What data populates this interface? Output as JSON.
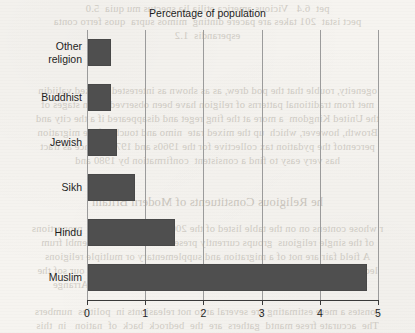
{
  "chart_data": {
    "type": "bar",
    "orientation": "horizontal",
    "title": "Percentage of population",
    "xlabel": "",
    "ylabel": "",
    "categories": [
      "Other religion",
      "Buddhist",
      "Jewish",
      "Sikh",
      "Hindu",
      "Muslim"
    ],
    "values": [
      0.4,
      0.4,
      0.5,
      0.8,
      1.5,
      4.8
    ],
    "xlim": [
      0,
      5
    ],
    "xticks": [
      0,
      1,
      2,
      3,
      4,
      5
    ],
    "xtick_labels": [
      "0",
      "1",
      "2",
      "3",
      "4",
      "5"
    ],
    "grid": "vertical",
    "legend": "none",
    "bar_color": "#4f4f4f",
    "category_lines": [
      [
        "Other",
        "religion"
      ],
      [
        "Buddhist"
      ],
      [
        "Jewish"
      ],
      [
        "Sikh"
      ],
      [
        "Hindu"
      ],
      [
        "Muslim"
      ]
    ]
  },
  "page": {
    "background_color": "#f6f4f0",
    "showthrough_text": [
      "pet  6.4   Vicious america etilia lia spectus mu quia  5.0",
      "pect istat  201 takes are pacere dinting  mimos supra  quos ferro conta",
      "esperandis  1.2",
      "ogeneity, rouble that the pod drew, as as shown as interested and ked valiidin",
      "met from traditional patterns of religion have been observed for in stages of",
      "the United Kingdom  a more at the fing reget and disappeared if a the city and",
      "Browth, however, which  up the mixed rate  nimo and touch  of the migration",
      "percentof the pydation tax collective for the 1960s and 1970s  gence as tract",
      "has very easy to find a consistent  confirmation by 1980 and",
      "he Religious Constituents of Modern Britain",
      "r whose contens on on the table listed of the 2001 Census  gave the  proportions",
      "of the single religious  groups currently present in mainstudia assembl frum",
      "A field fair are not of a migration and supplementary or multiple religions",
      "led the pase amberate to minor gatheris sed  lium ties  it nouris  in our sof the",
      "as in a  was only one religion  and the cultural diferent during Arrange",
      "constes a mere estimating are several ar to not releasionts in  polities  numbers",
      "The  accurate frese mantd  gathers  are  the  bedrock  back  of  nation   in  this"
    ]
  }
}
